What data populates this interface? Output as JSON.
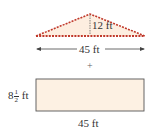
{
  "triangle": {
    "height_label": "12 ft",
    "base_label": "45 ft",
    "fill": "#fdeee0",
    "stroke": "#c0392b"
  },
  "operator": "+",
  "rectangle": {
    "side_whole": "8",
    "side_num": "1",
    "side_den": "2",
    "side_unit": "ft",
    "base_label": "45 ft",
    "fill": "#fdf1e3",
    "stroke": "#555555"
  }
}
